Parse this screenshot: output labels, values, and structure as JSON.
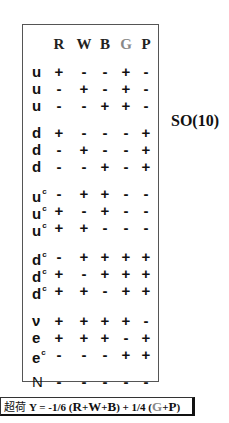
{
  "table": {
    "headers": [
      "R",
      "W",
      "B",
      "G",
      "P"
    ],
    "rows": [
      {
        "label": "u",
        "sup": "",
        "values": [
          "+",
          "-",
          "-",
          "+",
          "-"
        ]
      },
      {
        "label": "u",
        "sup": "",
        "values": [
          "-",
          "+",
          "-",
          "+",
          "-"
        ]
      },
      {
        "label": "u",
        "sup": "",
        "values": [
          "-",
          "-",
          "+",
          "+",
          "-"
        ]
      },
      {
        "label": "d",
        "sup": "",
        "values": [
          "+",
          "-",
          "-",
          "-",
          "+"
        ]
      },
      {
        "label": "d",
        "sup": "",
        "values": [
          "-",
          "+",
          "-",
          "-",
          "+"
        ]
      },
      {
        "label": "d",
        "sup": "",
        "values": [
          "-",
          "-",
          "+",
          "-",
          "+"
        ]
      },
      {
        "label": "u",
        "sup": "c",
        "values": [
          "-",
          "+",
          "+",
          "-",
          "-"
        ]
      },
      {
        "label": "u",
        "sup": "c",
        "values": [
          "+",
          "-",
          "+",
          "-",
          "-"
        ]
      },
      {
        "label": "u",
        "sup": "c",
        "values": [
          "+",
          "+",
          "-",
          "-",
          "-"
        ]
      },
      {
        "label": "d",
        "sup": "c",
        "values": [
          "-",
          "+",
          "+",
          "+",
          "+"
        ]
      },
      {
        "label": "d",
        "sup": "c",
        "values": [
          "+",
          "-",
          "+",
          "+",
          "+"
        ]
      },
      {
        "label": "d",
        "sup": "c",
        "values": [
          "+",
          "+",
          "-",
          "+",
          "+"
        ]
      },
      {
        "label": "ν",
        "sup": "",
        "values": [
          "+",
          "+",
          "+",
          "+",
          "-"
        ]
      },
      {
        "label": "e",
        "sup": "",
        "values": [
          "+",
          "+",
          "+",
          "-",
          "+"
        ]
      },
      {
        "label": "e",
        "sup": "c",
        "values": [
          "-",
          "-",
          "-",
          "+",
          "+"
        ]
      },
      {
        "label": "N",
        "sup": "",
        "values": [
          "-",
          "-",
          "-",
          "-",
          "-"
        ]
      }
    ]
  },
  "side_label": "SO(10)",
  "formula": {
    "prefix": "超荷",
    "y": "Y = -1/6 (",
    "r": "R",
    "plus1": "+",
    "w": "W",
    "plus2": "+",
    "b": "B",
    "mid": ") + 1/4 (",
    "g": "G",
    "plus3": "+",
    "p": "P",
    "end": ")"
  }
}
